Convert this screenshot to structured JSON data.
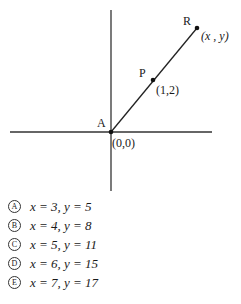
{
  "diagram": {
    "points": [
      {
        "name": "A",
        "coord_label": "(0,0)"
      },
      {
        "name": "P",
        "coord_label": "(1,2)"
      },
      {
        "name": "R",
        "coord_label": "(x , y)"
      }
    ]
  },
  "choices": [
    {
      "letter": "A",
      "text": "x = 3, y = 5"
    },
    {
      "letter": "B",
      "text": "x = 4, y = 8"
    },
    {
      "letter": "C",
      "text": "x = 5, y = 11"
    },
    {
      "letter": "D",
      "text": "x = 6, y = 15"
    },
    {
      "letter": "E",
      "text": "x = 7, y = 17"
    }
  ]
}
